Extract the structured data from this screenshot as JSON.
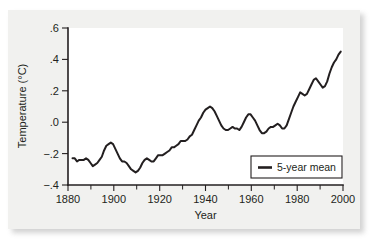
{
  "chart_data": {
    "type": "line",
    "title": "",
    "subtitle": "",
    "xlabel": "Year",
    "ylabel": "Temperature (°C)",
    "xlim": [
      1880,
      2002
    ],
    "ylim": [
      -0.4,
      0.6
    ],
    "grid": false,
    "legend_position": "bottom-right",
    "legend": [
      "5-year mean"
    ],
    "x_ticks": [
      1880,
      1900,
      1920,
      1940,
      1960,
      1980,
      2000
    ],
    "x_tick_labels": [
      "1880",
      "1900",
      "1920",
      "1940",
      "1960",
      "1980",
      "2000"
    ],
    "x_minor_ticks": [
      1890,
      1910,
      1930,
      1950,
      1970,
      1990
    ],
    "y_ticks": [
      -0.4,
      -0.2,
      0.0,
      0.2,
      0.4,
      0.6
    ],
    "y_tick_labels": [
      "−.4",
      "−.2",
      ".0",
      ".2",
      ".4",
      ".6"
    ],
    "line_color": "#231f20",
    "series": [
      {
        "name": "5-year mean",
        "x": [
          1882,
          1883,
          1884,
          1885,
          1886,
          1887,
          1888,
          1889,
          1890,
          1891,
          1892,
          1893,
          1894,
          1895,
          1896,
          1897,
          1898,
          1899,
          1900,
          1901,
          1902,
          1903,
          1904,
          1905,
          1906,
          1907,
          1908,
          1909,
          1910,
          1911,
          1912,
          1913,
          1914,
          1915,
          1916,
          1917,
          1918,
          1919,
          1920,
          1921,
          1922,
          1923,
          1924,
          1925,
          1926,
          1927,
          1928,
          1929,
          1930,
          1931,
          1932,
          1933,
          1934,
          1935,
          1936,
          1937,
          1938,
          1939,
          1940,
          1941,
          1942,
          1943,
          1944,
          1945,
          1946,
          1947,
          1948,
          1949,
          1950,
          1951,
          1952,
          1953,
          1954,
          1955,
          1956,
          1957,
          1958,
          1959,
          1960,
          1961,
          1962,
          1963,
          1964,
          1965,
          1966,
          1967,
          1968,
          1969,
          1970,
          1971,
          1972,
          1973,
          1974,
          1975,
          1976,
          1977,
          1978,
          1979,
          1980,
          1981,
          1982,
          1983,
          1984,
          1985,
          1986,
          1987,
          1988,
          1989,
          1990,
          1991,
          1992,
          1993,
          1994,
          1995,
          1996,
          1997,
          1998,
          1999,
          2000,
          2001
        ],
        "values": [
          -0.23,
          -0.23,
          -0.25,
          -0.24,
          -0.24,
          -0.24,
          -0.23,
          -0.24,
          -0.26,
          -0.28,
          -0.27,
          -0.26,
          -0.24,
          -0.22,
          -0.18,
          -0.15,
          -0.14,
          -0.13,
          -0.14,
          -0.17,
          -0.2,
          -0.23,
          -0.25,
          -0.25,
          -0.26,
          -0.28,
          -0.3,
          -0.31,
          -0.32,
          -0.31,
          -0.29,
          -0.26,
          -0.24,
          -0.23,
          -0.24,
          -0.25,
          -0.25,
          -0.23,
          -0.21,
          -0.21,
          -0.21,
          -0.2,
          -0.19,
          -0.18,
          -0.16,
          -0.16,
          -0.15,
          -0.14,
          -0.12,
          -0.12,
          -0.12,
          -0.11,
          -0.09,
          -0.08,
          -0.05,
          -0.02,
          0.01,
          0.03,
          0.06,
          0.08,
          0.09,
          0.1,
          0.09,
          0.07,
          0.04,
          0.01,
          -0.02,
          -0.04,
          -0.05,
          -0.05,
          -0.04,
          -0.03,
          -0.04,
          -0.04,
          -0.05,
          -0.03,
          0.0,
          0.03,
          0.05,
          0.05,
          0.03,
          0.01,
          -0.02,
          -0.05,
          -0.07,
          -0.07,
          -0.06,
          -0.04,
          -0.03,
          -0.03,
          -0.02,
          -0.01,
          -0.02,
          -0.04,
          -0.04,
          -0.02,
          0.02,
          0.06,
          0.1,
          0.13,
          0.16,
          0.19,
          0.18,
          0.17,
          0.18,
          0.21,
          0.24,
          0.27,
          0.28,
          0.26,
          0.24,
          0.22,
          0.23,
          0.26,
          0.31,
          0.35,
          0.38,
          0.4,
          0.43,
          0.45
        ]
      }
    ]
  },
  "legend": {
    "entries": [
      {
        "label": "5-year mean"
      }
    ]
  },
  "axes": {
    "x_title": "Year",
    "y_title": "Temperature (°C)",
    "x_labels": [
      "1880",
      "1900",
      "1920",
      "1940",
      "1960",
      "1980",
      "2000"
    ],
    "y_labels": [
      ".6",
      ".4",
      ".2",
      ".0",
      "−.2",
      "−.4"
    ]
  }
}
